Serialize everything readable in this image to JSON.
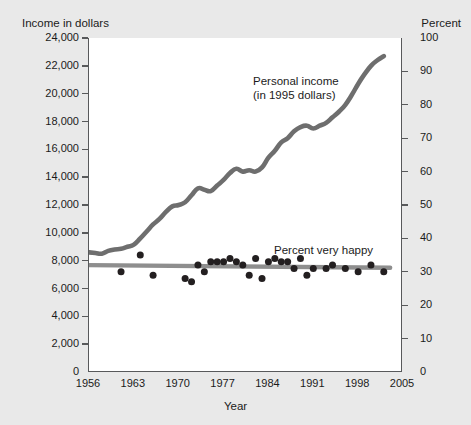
{
  "axes": {
    "left_title": "Income in dollars",
    "right_title": "Percent",
    "x_title": "Year",
    "left_ticks": [
      "24,000",
      "22,000",
      "20,000",
      "18,000",
      "16,000",
      "14,000",
      "12,000",
      "10,000",
      "8,000",
      "6,000",
      "4,000",
      "2,000",
      "0"
    ],
    "right_ticks": [
      "100",
      "90",
      "80",
      "70",
      "60",
      "50",
      "40",
      "30",
      "20",
      "10",
      "0"
    ],
    "x_ticks": [
      "1956",
      "1963",
      "1970",
      "1977",
      "1984",
      "1991",
      "1998",
      "2005"
    ]
  },
  "annotations": {
    "income_line1": "Personal income",
    "income_line2": "(in 1995 dollars)",
    "happy": "Percent very happy"
  },
  "colors": {
    "background": "#e9e9e9",
    "plot_background": "#ffffff",
    "axis": "#58595b",
    "income_line": "#6e6e6e",
    "happy_line": "#8e8e8e",
    "happy_dots": "#231f20",
    "text": "#1b1b1b"
  },
  "chart_data": {
    "type": "line",
    "title": "",
    "xlabel": "Year",
    "ylabel": "Income in dollars",
    "y2label": "Percent",
    "xlim": [
      1956,
      2005
    ],
    "ylim": [
      0,
      24000
    ],
    "y2lim": [
      0,
      100
    ],
    "grid": false,
    "legend": "annotations-inline",
    "series": [
      {
        "name": "Personal income (in 1995 dollars)",
        "type": "line",
        "axis": "left",
        "color": "#6e6e6e",
        "x": [
          1956,
          1957,
          1958,
          1959,
          1960,
          1961,
          1962,
          1963,
          1964,
          1965,
          1966,
          1967,
          1968,
          1969,
          1970,
          1971,
          1972,
          1973,
          1974,
          1975,
          1976,
          1977,
          1978,
          1979,
          1980,
          1981,
          1982,
          1983,
          1984,
          1985,
          1986,
          1987,
          1988,
          1989,
          1990,
          1991,
          1992,
          1993,
          1994,
          1995,
          1996,
          1997,
          1998,
          1999,
          2000,
          2001,
          2002
        ],
        "values": [
          8600,
          8550,
          8500,
          8700,
          8800,
          8850,
          9000,
          9150,
          9600,
          10100,
          10600,
          11000,
          11500,
          11900,
          12000,
          12200,
          12700,
          13200,
          13100,
          13000,
          13400,
          13800,
          14300,
          14600,
          14400,
          14500,
          14400,
          14700,
          15400,
          15900,
          16500,
          16800,
          17300,
          17600,
          17700,
          17500,
          17700,
          17900,
          18300,
          18700,
          19200,
          19900,
          20700,
          21400,
          22000,
          22400,
          22700
        ]
      },
      {
        "name": "Percent very happy",
        "type": "line-with-markers",
        "axis": "right",
        "color": "#8e8e8e",
        "marker_color": "#231f20",
        "x": [
          1956,
          1972,
          1973,
          1974,
          1975,
          1976,
          1977,
          1978,
          1980,
          1982,
          1983,
          1984,
          1985,
          1986,
          1987,
          1988,
          1989,
          1990,
          1991,
          1993,
          1994,
          1996,
          1998,
          2000,
          2002
        ],
        "values": [
          32,
          30,
          36,
          38,
          33,
          34,
          35,
          34,
          34,
          31,
          31,
          34,
          30,
          33,
          29,
          34,
          33,
          33,
          31,
          32,
          30,
          31,
          32,
          31,
          30
        ],
        "scatter_x": [
          1961,
          1964,
          1966,
          1971,
          1972,
          1973,
          1974,
          1975,
          1976,
          1977,
          1978,
          1979,
          1980,
          1981,
          1982,
          1983,
          1984,
          1985,
          1986,
          1987,
          1988,
          1989,
          1990,
          1991,
          1993,
          1994,
          1996,
          1998,
          2000,
          2002
        ],
        "scatter_values": [
          30,
          35,
          29,
          28,
          27,
          32,
          30,
          33,
          33,
          33,
          34,
          33,
          32,
          29,
          34,
          28,
          33,
          34,
          33,
          33,
          31,
          34,
          29,
          31,
          31,
          32,
          31,
          30,
          32,
          30
        ]
      }
    ]
  }
}
